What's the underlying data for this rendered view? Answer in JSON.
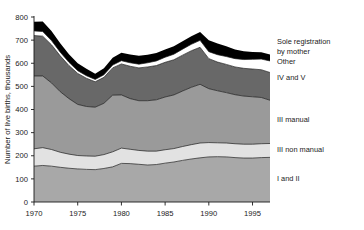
{
  "chart_data": {
    "type": "area",
    "stacked": true,
    "title": "",
    "xlabel": "",
    "ylabel": "Number of live births, thousands",
    "xlim": [
      1970,
      1997
    ],
    "ylim": [
      0,
      800
    ],
    "ytick_labels": [
      "0",
      "100",
      "200",
      "300",
      "400",
      "500",
      "600",
      "700",
      "800"
    ],
    "yticks": [
      0,
      100,
      200,
      300,
      400,
      500,
      600,
      700,
      800
    ],
    "xtick_labels": [
      "1970",
      "1975",
      "1980",
      "1985",
      "1990",
      "1995"
    ],
    "xticks": [
      1970,
      1975,
      1980,
      1985,
      1990,
      1995
    ],
    "grid": false,
    "legend_position": "right-inline",
    "x": [
      1970,
      1971,
      1972,
      1973,
      1974,
      1975,
      1976,
      1977,
      1978,
      1979,
      1980,
      1981,
      1982,
      1983,
      1984,
      1985,
      1986,
      1987,
      1988,
      1989,
      1990,
      1991,
      1992,
      1993,
      1994,
      1995,
      1996,
      1997
    ],
    "series": [
      {
        "name": "I and II",
        "color": "#a8a8a8",
        "values": [
          155,
          158,
          155,
          150,
          146,
          143,
          141,
          140,
          145,
          152,
          167,
          166,
          163,
          160,
          162,
          168,
          173,
          180,
          186,
          191,
          195,
          196,
          195,
          192,
          190,
          190,
          192,
          193
        ]
      },
      {
        "name": "III non manual",
        "color": "#e2e2e2",
        "values": [
          75,
          77,
          72,
          65,
          61,
          58,
          58,
          58,
          60,
          65,
          66,
          62,
          60,
          60,
          58,
          58,
          58,
          60,
          62,
          64,
          62,
          60,
          60,
          60,
          60,
          60,
          60,
          60
        ]
      },
      {
        "name": "III manual",
        "color": "#9a9a9a",
        "values": [
          315,
          310,
          288,
          262,
          240,
          221,
          214,
          212,
          222,
          245,
          230,
          219,
          215,
          218,
          222,
          228,
          232,
          240,
          248,
          254,
          233,
          225,
          218,
          212,
          208,
          205,
          200,
          187
        ]
      },
      {
        "name": "IV and V",
        "color": "#686868",
        "values": [
          175,
          172,
          165,
          155,
          143,
          134,
          122,
          110,
          112,
          118,
          134,
          140,
          142,
          146,
          148,
          150,
          152,
          155,
          158,
          160,
          130,
          124,
          122,
          120,
          120,
          120,
          120,
          120
        ]
      },
      {
        "name": "Other",
        "color": "#ffffff",
        "values": [
          20,
          20,
          18,
          16,
          14,
          12,
          11,
          10,
          11,
          12,
          14,
          15,
          16,
          18,
          20,
          22,
          24,
          26,
          28,
          30,
          30,
          32,
          34,
          36,
          38,
          42,
          46,
          50
        ]
      },
      {
        "name": "Sole registration by mother",
        "color": "#000000",
        "values": [
          40,
          44,
          42,
          38,
          35,
          32,
          30,
          25,
          28,
          32,
          34,
          36,
          36,
          35,
          34,
          34,
          34,
          34,
          35,
          36,
          50,
          48,
          44,
          40,
          36,
          32,
          30,
          28
        ]
      }
    ],
    "cumulative_tops": {
      "1970": [
        155,
        230,
        545,
        720,
        740,
        780
      ],
      "1977": [
        140,
        198,
        410,
        520,
        530,
        555
      ],
      "1980": [
        167,
        233,
        463,
        597,
        611,
        645
      ],
      "1985": [
        168,
        226,
        454,
        604,
        626,
        660
      ],
      "1990": [
        195,
        257,
        490,
        620,
        650,
        700
      ],
      "1997": [
        193,
        253,
        440,
        560,
        610,
        638
      ]
    }
  },
  "legend": {
    "items": [
      {
        "label": "Sole registration",
        "key": "sole-registration"
      },
      {
        "label": "by mother",
        "key": "by-mother"
      },
      {
        "label": "Other",
        "key": "other"
      },
      {
        "label": "IV and V",
        "key": "iv-and-v"
      },
      {
        "label": "III manual",
        "key": "iii-manual"
      },
      {
        "label": "III non manual",
        "key": "iii-non-manual"
      },
      {
        "label": "I and II",
        "key": "i-and-ii"
      }
    ]
  }
}
